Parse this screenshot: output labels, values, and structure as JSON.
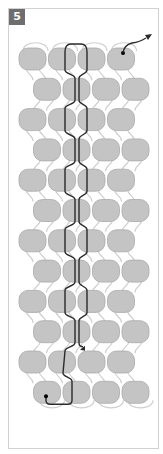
{
  "figure": {
    "step_number": "5"
  },
  "colors": {
    "bead_fill": "#c4c4c4",
    "bead_stroke": "#a9a9a9",
    "connector": "#cfcfcf",
    "thread": "#2a2a2a",
    "badge_bg": "#6e6e6e",
    "frame": "#d2d2d2"
  },
  "grid": {
    "rows": 12,
    "beads_per_row": 4,
    "first_row_top": 48,
    "row_pitch": 30.3,
    "bead_width": 27,
    "bead_height": 22,
    "bead_pitch": 29.5,
    "odd_row_left": 19,
    "even_row_left": 33.5
  }
}
